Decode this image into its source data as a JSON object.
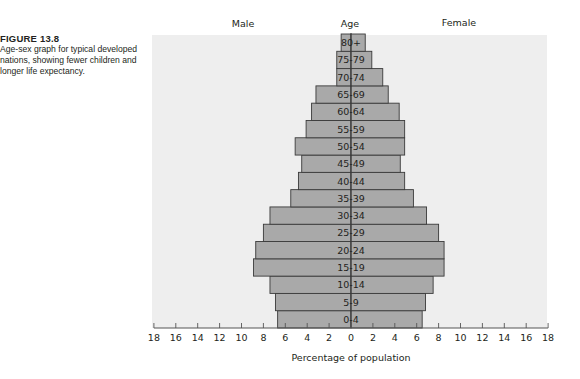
{
  "caption": {
    "title": "FIGURE 13.8",
    "text": "Age-sex graph for typical developed nations, showing fewer children and longer life expectancy."
  },
  "colors": {
    "plot_background": "#eeeeee",
    "bar_fill": "#a9a9a9",
    "bar_stroke": "#3a3a3a",
    "text": "#231f20",
    "axis": "#555555"
  },
  "chart_data": {
    "type": "bar",
    "orientation": "horizontal",
    "subtype": "population-pyramid",
    "title": "",
    "left_label": "Male",
    "center_label": "Age",
    "right_label": "Female",
    "xlabel": "Percentage of population",
    "ylabel": "Age",
    "xlim": [
      -18,
      18
    ],
    "x_ticks": [
      18,
      16,
      14,
      12,
      10,
      8,
      6,
      4,
      2,
      0,
      2,
      4,
      6,
      8,
      10,
      12,
      14,
      16,
      18
    ],
    "grid": false,
    "legend": "none",
    "categories": [
      "0-4",
      "5-9",
      "10-14",
      "15-19",
      "20-24",
      "25-29",
      "30-34",
      "35-39",
      "40-44",
      "45-49",
      "50-54",
      "55-59",
      "60-64",
      "65-69",
      "70-74",
      "75-79",
      "80+"
    ],
    "series": [
      {
        "name": "Male",
        "values": [
          6.7,
          6.9,
          7.4,
          8.9,
          8.7,
          8.0,
          7.4,
          5.5,
          4.8,
          4.5,
          5.1,
          4.1,
          3.6,
          3.2,
          1.3,
          1.3,
          0.9
        ]
      },
      {
        "name": "Female",
        "values": [
          6.5,
          6.8,
          7.5,
          8.5,
          8.5,
          8.0,
          6.9,
          5.7,
          4.9,
          4.5,
          4.9,
          4.9,
          4.4,
          3.4,
          2.9,
          1.9,
          1.3
        ]
      }
    ]
  }
}
